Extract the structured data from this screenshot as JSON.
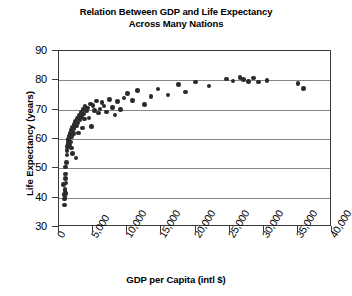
{
  "chart_data": {
    "type": "scatter",
    "title": "Relation Between GDP and Life Expectancy Across Many Nations",
    "title_line1": "Relation Between GDP and Life Expectancy",
    "title_line2": "Across Many Nations",
    "xlabel": "GDP per Capita (intl $)",
    "ylabel": "Life Expectancy (years)",
    "xlim": [
      0,
      40000
    ],
    "ylim": [
      30,
      90
    ],
    "xticks": [
      0,
      5000,
      10000,
      15000,
      20000,
      25000,
      30000,
      35000,
      40000
    ],
    "xtick_labels": [
      "0",
      "5,000",
      "10,000",
      "15,000",
      "20,000",
      "25,000",
      "30,000",
      "35,000",
      "40,000"
    ],
    "yticks": [
      30,
      40,
      50,
      60,
      70,
      80,
      90
    ],
    "ytick_labels": [
      "30",
      "40",
      "50",
      "60",
      "70",
      "80",
      "90"
    ],
    "grid": "horizontal",
    "legend": null,
    "marker_color": "#2b2b2b",
    "axis_color": "#3a3a3a",
    "gridline_color": "#878787",
    "n_points": 86,
    "points": [
      [
        700,
        44.5
      ],
      [
        750,
        41.0
      ],
      [
        800,
        39.5
      ],
      [
        820,
        37.5
      ],
      [
        850,
        42.5
      ],
      [
        880,
        40.0
      ],
      [
        900,
        43.0
      ],
      [
        930,
        46.5
      ],
      [
        950,
        48.0
      ],
      [
        980,
        50.5
      ],
      [
        1000,
        41.5
      ],
      [
        1050,
        45.0
      ],
      [
        1100,
        52.0
      ],
      [
        1150,
        54.5
      ],
      [
        1200,
        56.0
      ],
      [
        1250,
        57.5
      ],
      [
        1300,
        58.5
      ],
      [
        1350,
        59.5
      ],
      [
        1400,
        60.0
      ],
      [
        1450,
        60.5
      ],
      [
        1500,
        61.0
      ],
      [
        1550,
        58.0
      ],
      [
        1600,
        62.0
      ],
      [
        1650,
        59.0
      ],
      [
        1700,
        61.5
      ],
      [
        1750,
        63.0
      ],
      [
        1800,
        57.0
      ],
      [
        1850,
        60.8
      ],
      [
        1900,
        62.5
      ],
      [
        1950,
        55.0
      ],
      [
        2000,
        64.0
      ],
      [
        2100,
        61.8
      ],
      [
        2200,
        63.5
      ],
      [
        2300,
        65.0
      ],
      [
        2400,
        66.0
      ],
      [
        2500,
        53.5
      ],
      [
        2600,
        64.5
      ],
      [
        2700,
        67.0
      ],
      [
        2800,
        65.5
      ],
      [
        2900,
        62.0
      ],
      [
        3000,
        68.0
      ],
      [
        3100,
        66.5
      ],
      [
        3200,
        69.0
      ],
      [
        3300,
        67.5
      ],
      [
        3400,
        63.8
      ],
      [
        3500,
        70.0
      ],
      [
        3600,
        68.5
      ],
      [
        3700,
        66.8
      ],
      [
        3800,
        71.0
      ],
      [
        4000,
        69.5
      ],
      [
        4200,
        70.5
      ],
      [
        4400,
        67.2
      ],
      [
        4600,
        72.0
      ],
      [
        4800,
        64.2
      ],
      [
        5000,
        71.5
      ],
      [
        5200,
        69.8
      ],
      [
        5500,
        73.0
      ],
      [
        5800,
        68.8
      ],
      [
        6000,
        70.2
      ],
      [
        6300,
        72.5
      ],
      [
        6600,
        71.2
      ],
      [
        7000,
        69.2
      ],
      [
        7400,
        73.5
      ],
      [
        7800,
        70.8
      ],
      [
        8200,
        68.2
      ],
      [
        8600,
        72.8
      ],
      [
        9000,
        70.0
      ],
      [
        9500,
        74.0
      ],
      [
        10000,
        75.5
      ],
      [
        10800,
        73.2
      ],
      [
        11500,
        76.5
      ],
      [
        12500,
        71.8
      ],
      [
        13500,
        74.5
      ],
      [
        14500,
        77.0
      ],
      [
        16000,
        75.0
      ],
      [
        17500,
        78.5
      ],
      [
        18500,
        76.0
      ],
      [
        20000,
        79.5
      ],
      [
        22000,
        78.0
      ],
      [
        24500,
        80.5
      ],
      [
        25500,
        79.8
      ],
      [
        26500,
        81.0
      ],
      [
        27000,
        80.2
      ],
      [
        27800,
        79.6
      ],
      [
        28500,
        80.8
      ],
      [
        29200,
        79.4
      ],
      [
        30500,
        80.0
      ],
      [
        35000,
        79.0
      ],
      [
        35800,
        77.2
      ]
    ]
  }
}
